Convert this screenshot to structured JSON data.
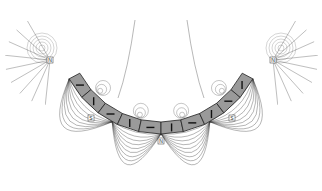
{
  "diagram": {
    "type": "magnetic field lines around curved magnet array",
    "background": "#ffffff",
    "ink": "#333333",
    "magnet_fill": "#9a9a9a",
    "pole_labels": [
      {
        "id": "left-end",
        "text": "N",
        "x": 50,
        "y": 60
      },
      {
        "id": "left-mid",
        "text": "S",
        "x": 91,
        "y": 118
      },
      {
        "id": "center",
        "text": "N",
        "x": 161,
        "y": 141
      },
      {
        "id": "right-mid",
        "text": "S",
        "x": 232,
        "y": 118
      },
      {
        "id": "right-end",
        "text": "N",
        "x": 273,
        "y": 60
      }
    ],
    "segments": 10
  }
}
